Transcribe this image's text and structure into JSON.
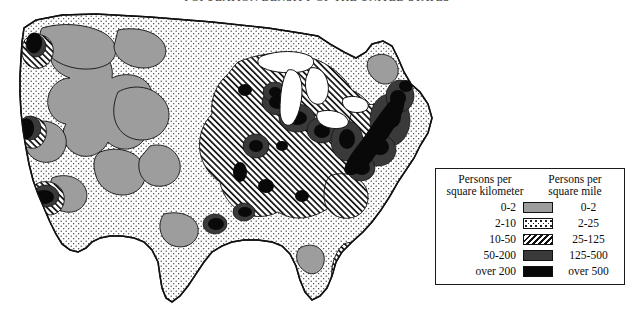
{
  "title": "Population Density of the United States",
  "legend": {
    "head_left_line1": "Persons per",
    "head_left_line2": "square kilometer",
    "head_right_line1": "Persons per",
    "head_right_line2": "square mile",
    "rows": [
      {
        "km": "0-2",
        "mile": "0-2",
        "swatch": "solid-light-gray",
        "color": "#9d9d9d"
      },
      {
        "km": "2-10",
        "mile": "2-25",
        "swatch": "stipple-dots",
        "color": "#ffffff"
      },
      {
        "km": "10-50",
        "mile": "25-125",
        "swatch": "diagonal-hatch",
        "color": "#ffffff"
      },
      {
        "km": "50-200",
        "mile": "125-500",
        "swatch": "solid-dark-gray",
        "color": "#3a3a3a"
      },
      {
        "km": "over 200",
        "mile": "over 500",
        "swatch": "solid-black",
        "color": "#080808"
      }
    ]
  },
  "map": {
    "outline_color": "#111111",
    "background": "#ffffff"
  }
}
